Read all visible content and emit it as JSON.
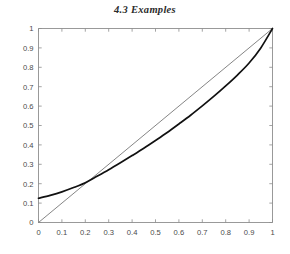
{
  "figure": {
    "title": "4.3  Examples"
  },
  "chart_data": {
    "type": "line",
    "title": "4.3  Examples",
    "xlabel": "",
    "ylabel": "",
    "xlim": [
      0,
      1
    ],
    "ylim": [
      0,
      1
    ],
    "grid": false,
    "legend": null,
    "xticks": [
      "0",
      "0.1",
      "0.2",
      "0.3",
      "0.4",
      "0.5",
      "0.6",
      "0.7",
      "0.8",
      "0.9",
      "1"
    ],
    "xtick_values": [
      0,
      0.1,
      0.2,
      0.3,
      0.4,
      0.5,
      0.6,
      0.7,
      0.8,
      0.9,
      1
    ],
    "yticks": [
      "0",
      "0.1",
      "0.2",
      "0.3",
      "0.4",
      "0.5",
      "0.6",
      "0.7",
      "0.8",
      "0.9",
      "1"
    ],
    "ytick_values": [
      0,
      0.1,
      0.2,
      0.3,
      0.4,
      0.5,
      0.6,
      0.7,
      0.8,
      0.9,
      1
    ],
    "axis_color": "#8d8d8d",
    "tick_label_color": "#4a4a4a",
    "series": [
      {
        "name": "curve",
        "style": "solid-thick",
        "color": "#111111",
        "width": 1.7,
        "x": [
          0.0,
          0.05,
          0.1,
          0.15,
          0.2,
          0.25,
          0.3,
          0.35,
          0.4,
          0.45,
          0.5,
          0.55,
          0.6,
          0.65,
          0.7,
          0.75,
          0.8,
          0.85,
          0.9,
          0.95,
          1.0
        ],
        "values": [
          0.125,
          0.14,
          0.158,
          0.18,
          0.205,
          0.238,
          0.272,
          0.308,
          0.345,
          0.383,
          0.423,
          0.464,
          0.508,
          0.553,
          0.601,
          0.651,
          0.704,
          0.76,
          0.822,
          0.9,
          1.0
        ]
      },
      {
        "name": "diagonal",
        "style": "solid-thin",
        "color": "#6f6f6f",
        "width": 0.85,
        "x": [
          0,
          1
        ],
        "values": [
          0,
          1
        ]
      }
    ],
    "annotations": [
      {
        "text": "curve starts at (0, 0.125)",
        "x": 0,
        "y": 0.125
      },
      {
        "text": "curves meet at (1, 1)",
        "x": 1,
        "y": 1
      },
      {
        "text": "intersection near (0.235, 0.235)",
        "x": 0.235,
        "y": 0.235
      }
    ]
  }
}
